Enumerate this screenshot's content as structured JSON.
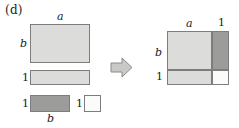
{
  "figure": {
    "panel_label": "(d)",
    "identity_illustrated": "(a + 1)(b + 1) = ab + a + b + 1",
    "arrow_icon": "right-arrow-icon",
    "colors": {
      "light_gray": "#dcdcda",
      "mid_gray": "#a8a8a6",
      "dark_gray": "#9c9c9a",
      "white": "#fbfbf9",
      "outline": "#7d7d7d",
      "text": "#1a1a1a",
      "background": "#ffffff"
    }
  },
  "left_group": {
    "caption": "four separate pieces",
    "pieces": [
      {
        "name": "rectangle-ab",
        "fill": "light_gray",
        "width_label": "a",
        "height_label": "b",
        "width_label_pos": "top",
        "height_label_pos": "left",
        "area": "ab"
      },
      {
        "name": "rectangle-a",
        "fill": "light_gray",
        "width_label": "",
        "height_label": "1",
        "width_label_pos": "none",
        "height_label_pos": "left",
        "area": "a"
      },
      {
        "name": "rectangle-b",
        "fill": "dark_gray",
        "width_label": "b",
        "height_label": "1",
        "width_label_pos": "bottom",
        "height_label_pos": "left",
        "area": "b"
      },
      {
        "name": "square-unit",
        "fill": "white",
        "width_label": "",
        "height_label": "1",
        "width_label_pos": "none",
        "height_label_pos": "left",
        "area": "1"
      }
    ]
  },
  "right_group": {
    "caption": "assembled rectangle",
    "outer_width_labels": [
      "a",
      "1"
    ],
    "outer_height_labels": [
      "b",
      "1"
    ],
    "cells": [
      {
        "name": "cell-ab",
        "fill": "light_gray",
        "area": "ab"
      },
      {
        "name": "cell-b",
        "fill": "dark_gray",
        "area": "b"
      },
      {
        "name": "cell-a",
        "fill": "light_gray",
        "area": "a"
      },
      {
        "name": "cell-1",
        "fill": "white",
        "area": "1"
      }
    ]
  }
}
